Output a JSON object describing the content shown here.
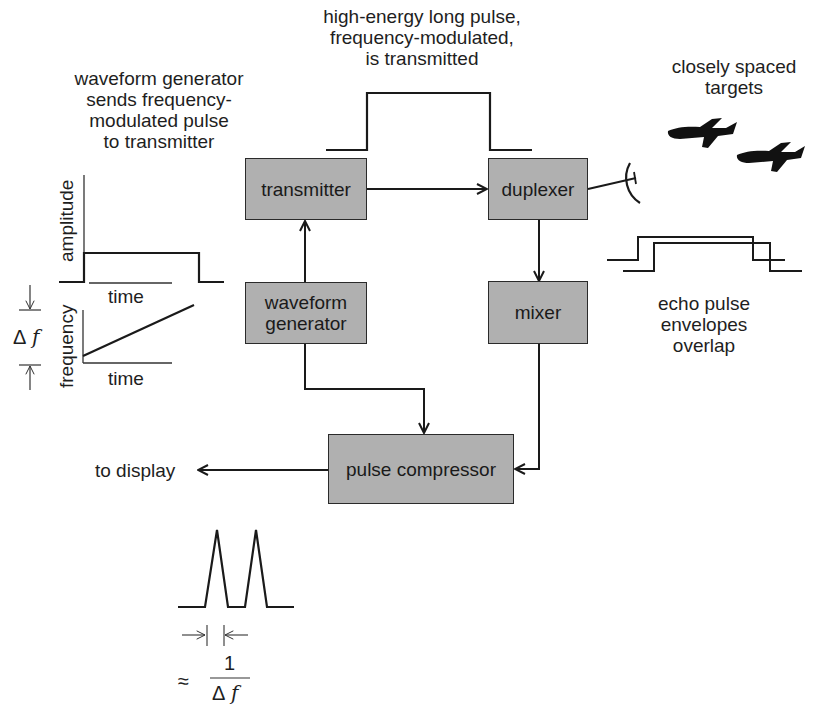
{
  "annotations": {
    "waveform_generator_note": [
      "waveform generator",
      "sends frequency-",
      "modulated pulse",
      "to transmitter"
    ],
    "transmitted_note": [
      "high-energy long pulse,",
      "frequency-modulated,",
      "is transmitted"
    ],
    "targets_note": [
      "closely spaced",
      "targets"
    ],
    "echo_note": [
      "echo pulse",
      "envelopes",
      "overlap"
    ],
    "to_display": "to display"
  },
  "blocks": {
    "transmitter": "transmitter",
    "duplexer": "duplexer",
    "waveform_generator": [
      "waveform",
      "generator"
    ],
    "mixer": "mixer",
    "pulse_compressor": "pulse compressor"
  },
  "inset_plots": {
    "amplitude": {
      "ylabel": "amplitude",
      "xlabel": "time"
    },
    "frequency": {
      "ylabel": "frequency",
      "xlabel": "time",
      "bandwidth_label": "Δ",
      "bandwidth_var": "f"
    }
  },
  "output_resolution": {
    "approx": "≈",
    "numerator": "1",
    "denominator_symbol": "Δ",
    "denominator_var": "f"
  },
  "colors": {
    "block_fill": "#b0b0b0",
    "stroke": "#1a1a1a",
    "background": "#ffffff"
  }
}
